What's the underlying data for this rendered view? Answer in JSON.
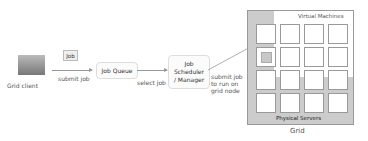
{
  "grid_client": {
    "label": "Grid client"
  },
  "job_tag": {
    "label": "Job"
  },
  "edges": {
    "submit_job": "submit job",
    "select_job": "select job",
    "submit_to_node": [
      "submit job",
      "to run on",
      "grid node"
    ]
  },
  "job_queue": {
    "label": "Job Queue"
  },
  "scheduler": {
    "lines": [
      "Job",
      "Scheduler",
      "/ Manager"
    ]
  },
  "grid": {
    "title": "Grid",
    "virtual_machines_label": "Virtual Machines",
    "physical_servers_label": "Physical Servers",
    "rows": 4,
    "cols": 4,
    "active_cell": [
      1,
      0
    ]
  }
}
